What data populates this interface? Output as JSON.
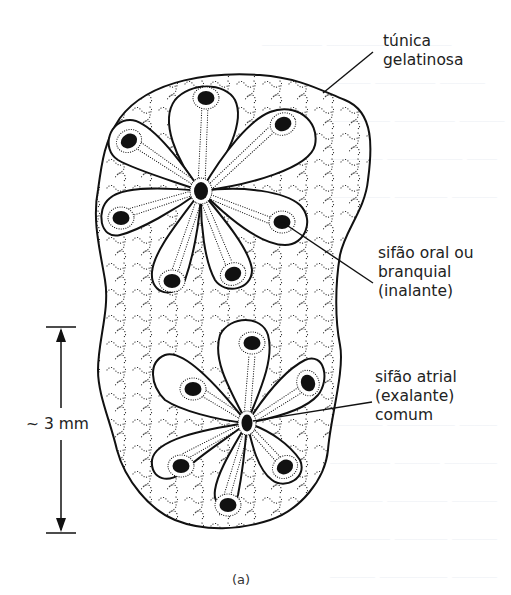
{
  "figure": {
    "caption": "(a)"
  },
  "labels": {
    "tunic": {
      "lines": [
        "túnica",
        "gelatinosa"
      ]
    },
    "oral_siphon": {
      "lines": [
        "sifão oral ou",
        "branquial",
        "(inalante)"
      ]
    },
    "atrial_siphon": {
      "lines": [
        "sifão atrial",
        "(exalante)",
        "comum"
      ]
    }
  },
  "scale_bar": {
    "label": "~ 3 mm"
  },
  "structures": {
    "upper_system_zooids": 8,
    "lower_system_zooids": 7
  },
  "colors": {
    "ink": "#111111",
    "text": "#222222",
    "background": "#ffffff",
    "bleed_through": "#eef1f6"
  }
}
